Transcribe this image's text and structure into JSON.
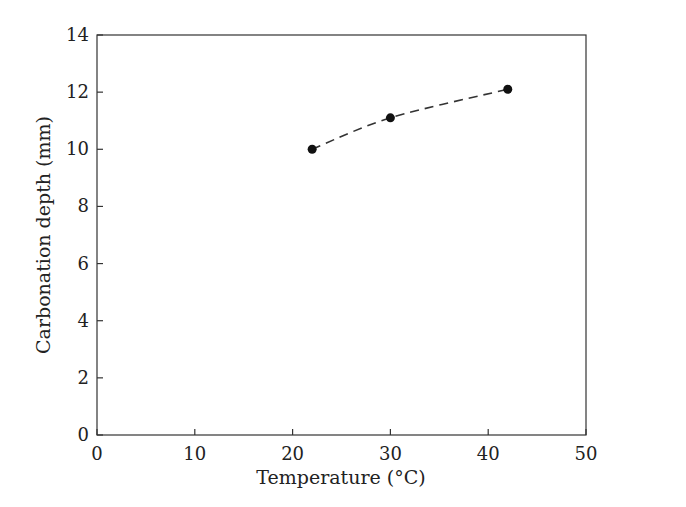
{
  "chart_data": {
    "type": "line",
    "title": "",
    "xlabel": "Temperature (°C)",
    "ylabel": "Carbonation depth (mm)",
    "xlim": [
      0,
      50
    ],
    "ylim": [
      0,
      14
    ],
    "xticks": [
      0,
      10,
      20,
      30,
      40,
      50
    ],
    "yticks": [
      0,
      2,
      4,
      6,
      8,
      10,
      12,
      14
    ],
    "grid": false,
    "legend": null,
    "series": [
      {
        "name": "Carbonation depth",
        "style": "dashed line with filled circle markers",
        "x": [
          22,
          30,
          42
        ],
        "y": [
          10.0,
          11.1,
          12.1
        ]
      }
    ]
  }
}
